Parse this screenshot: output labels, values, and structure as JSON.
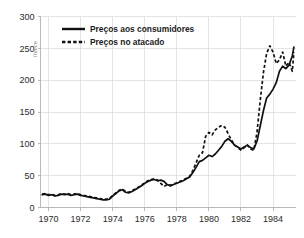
{
  "chart_data": {
    "type": "line",
    "title": "",
    "xlabel": "",
    "ylabel": "índice",
    "xlim": [
      1969.5,
      1985.4
    ],
    "ylim": [
      0,
      300
    ],
    "grid": true,
    "legend_position": "top-left-inside",
    "y_ticks": [
      0,
      50,
      100,
      150,
      200,
      250,
      300
    ],
    "y_tick_labels": [
      "0",
      "50",
      "100",
      "150",
      "200",
      "250",
      "300"
    ],
    "x_ticks": [
      1970,
      1972,
      1974,
      1976,
      1978,
      1980,
      1982,
      1984
    ],
    "x_tick_labels": [
      "1970",
      "1972",
      "1974",
      "1976",
      "1978",
      "1980",
      "1982",
      "1984"
    ],
    "series": [
      {
        "name": "Preços aos consumidores",
        "style": "solid",
        "color": "#111111",
        "x": [
          1969.6,
          1969.8,
          1970.0,
          1970.2,
          1970.4,
          1970.6,
          1970.8,
          1971.0,
          1971.2,
          1971.4,
          1971.6,
          1971.8,
          1972.0,
          1972.2,
          1972.4,
          1972.6,
          1972.8,
          1973.0,
          1973.2,
          1973.4,
          1973.6,
          1973.8,
          1974.0,
          1974.2,
          1974.4,
          1974.6,
          1974.8,
          1975.0,
          1975.2,
          1975.4,
          1975.6,
          1975.8,
          1976.0,
          1976.2,
          1976.4,
          1976.6,
          1976.8,
          1977.0,
          1977.2,
          1977.4,
          1977.6,
          1977.8,
          1978.0,
          1978.2,
          1978.4,
          1978.6,
          1978.8,
          1979.0,
          1979.2,
          1979.4,
          1979.6,
          1979.8,
          1980.0,
          1980.2,
          1980.4,
          1980.6,
          1980.8,
          1981.0,
          1981.2,
          1981.4,
          1981.6,
          1981.8,
          1982.0,
          1982.2,
          1982.4,
          1982.6,
          1982.8,
          1983.0,
          1983.2,
          1983.4,
          1983.6,
          1983.8,
          1984.0,
          1984.2,
          1984.4,
          1984.6,
          1984.8,
          1985.0,
          1985.2,
          1985.3
        ],
        "y": [
          20,
          21,
          19,
          20,
          18,
          19,
          21,
          20,
          21,
          19,
          20,
          21,
          19,
          18,
          17,
          16,
          15,
          14,
          13,
          12,
          12,
          13,
          18,
          22,
          26,
          28,
          24,
          23,
          25,
          28,
          31,
          34,
          38,
          41,
          43,
          44,
          42,
          43,
          41,
          36,
          34,
          36,
          38,
          40,
          42,
          45,
          48,
          55,
          63,
          72,
          74,
          78,
          82,
          80,
          84,
          90,
          96,
          104,
          108,
          104,
          98,
          95,
          92,
          95,
          98,
          94,
          92,
          104,
          128,
          152,
          172,
          178,
          186,
          196,
          214,
          222,
          218,
          224,
          238,
          252
        ]
      },
      {
        "name": "Preços no atacado",
        "style": "dashed",
        "color": "#111111",
        "x": [
          1969.6,
          1969.8,
          1970.0,
          1970.2,
          1970.4,
          1970.6,
          1970.8,
          1971.0,
          1971.2,
          1971.4,
          1971.6,
          1971.8,
          1972.0,
          1972.2,
          1972.4,
          1972.6,
          1972.8,
          1973.0,
          1973.2,
          1973.4,
          1973.6,
          1973.8,
          1974.0,
          1974.2,
          1974.4,
          1974.6,
          1974.8,
          1975.0,
          1975.2,
          1975.4,
          1975.6,
          1975.8,
          1976.0,
          1976.2,
          1976.4,
          1976.6,
          1976.8,
          1977.0,
          1977.2,
          1977.4,
          1977.6,
          1977.8,
          1978.0,
          1978.2,
          1978.4,
          1978.6,
          1978.8,
          1979.0,
          1979.2,
          1979.4,
          1979.6,
          1979.8,
          1980.0,
          1980.2,
          1980.4,
          1980.6,
          1980.8,
          1981.0,
          1981.2,
          1981.4,
          1981.6,
          1981.8,
          1982.0,
          1982.2,
          1982.4,
          1982.6,
          1982.8,
          1983.0,
          1983.2,
          1983.4,
          1983.6,
          1983.8,
          1984.0,
          1984.2,
          1984.4,
          1984.6,
          1984.8,
          1985.0,
          1985.2,
          1985.3
        ],
        "y": [
          21,
          22,
          20,
          21,
          19,
          20,
          22,
          21,
          22,
          20,
          21,
          22,
          20,
          19,
          18,
          17,
          16,
          15,
          14,
          13,
          13,
          14,
          19,
          23,
          27,
          29,
          25,
          24,
          26,
          29,
          32,
          35,
          39,
          42,
          44,
          45,
          43,
          38,
          33,
          36,
          35,
          37,
          39,
          41,
          43,
          46,
          49,
          58,
          70,
          82,
          86,
          112,
          118,
          114,
          122,
          126,
          129,
          126,
          116,
          106,
          98,
          94,
          90,
          94,
          98,
          92,
          90,
          118,
          168,
          212,
          242,
          254,
          244,
          226,
          232,
          244,
          222,
          228,
          214,
          244
        ]
      }
    ]
  },
  "legend": {
    "entries": [
      {
        "label": "Preços aos consumidores",
        "style": "solid"
      },
      {
        "label": "Preços no atacado",
        "style": "dashed"
      }
    ]
  }
}
